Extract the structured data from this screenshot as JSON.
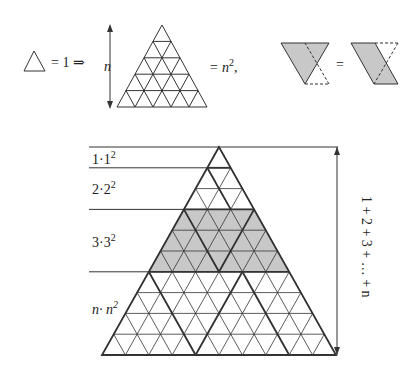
{
  "top": {
    "unit_eq": "= 1 ⇒",
    "n_label": "n",
    "n2_eq": "= n",
    "n2_sup": "2",
    "n2_tail": ",",
    "shape_eq": "="
  },
  "levels": [
    {
      "label": "1·1",
      "sup": "2"
    },
    {
      "label": "2·2",
      "sup": "2"
    },
    {
      "label": "3·3",
      "sup": "2"
    },
    {
      "label": "n· n",
      "sup": "2"
    }
  ],
  "side_label": "1 + 2 + 3 + … + n",
  "colors": {
    "line": "#333333",
    "shade": "#c8c8c8"
  }
}
